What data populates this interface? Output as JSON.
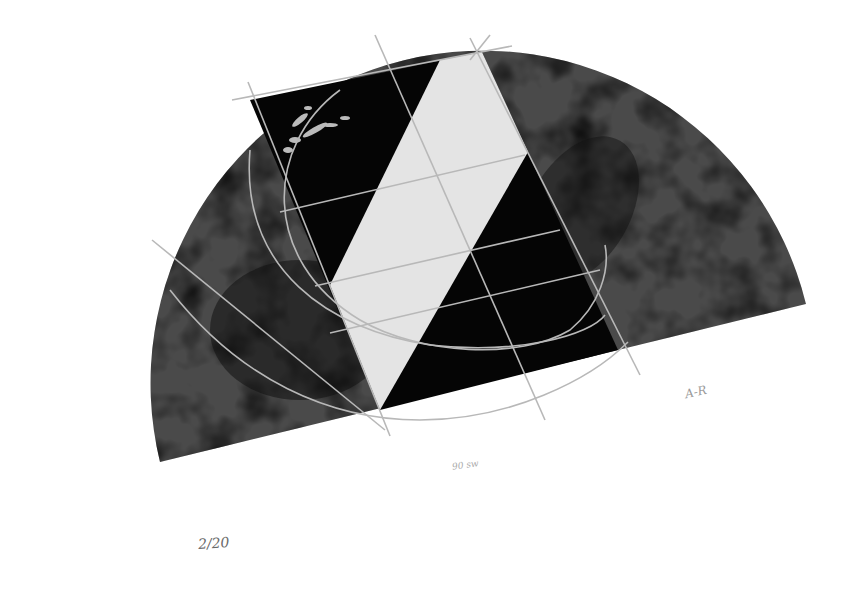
{
  "artwork": {
    "description": "Abstract geometric print: mottled grey semicircle overlaid with a tilted black rectangle split by a white diagonal band, with pencil construction lines and arcs",
    "colors": {
      "paper": "#ffffff",
      "semicircle": "#3a3a3a",
      "rectangle": "#050505",
      "band": "#e4e4e4",
      "construction_lines": "#b8b8b8"
    }
  },
  "inscriptions": {
    "edition": "2/20",
    "title_note": "90 sw",
    "signature": "A-R"
  }
}
